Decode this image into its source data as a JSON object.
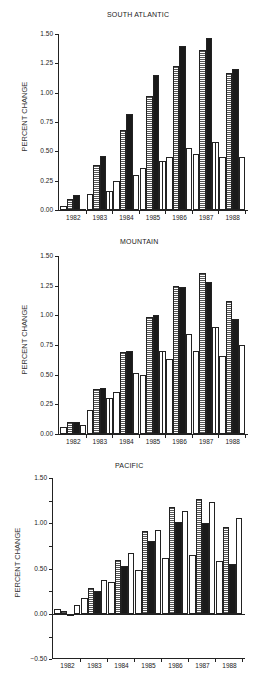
{
  "chart_data": [
    {
      "type": "bar",
      "title": "SOUTH ATLANTIC",
      "xlabel": "",
      "ylabel": "PERCENT CHANGE",
      "ylim": [
        0.0,
        1.5
      ],
      "yticks": [
        "0.00",
        "0.25",
        "0.50",
        "0.75",
        "1.00",
        "1.25",
        "1.50"
      ],
      "categories": [
        "1982",
        "1983",
        "1984",
        "1985",
        "1986",
        "1987",
        "1988"
      ],
      "grid": false,
      "legend": "none",
      "series": [
        {
          "name": "Series 1 (open)",
          "pattern": "white",
          "values": [
            0.03,
            0.14,
            0.25,
            0.36,
            0.45,
            0.48,
            0.45
          ]
        },
        {
          "name": "Series 2 (horizontal hatch)",
          "pattern": "hstripe",
          "values": [
            0.09,
            0.38,
            0.68,
            0.97,
            1.23,
            1.36,
            1.17
          ]
        },
        {
          "name": "Series 3 (solid)",
          "pattern": "black",
          "values": [
            0.13,
            0.46,
            0.82,
            1.15,
            1.4,
            1.47,
            1.2
          ]
        },
        {
          "name": "Series 4 (vertical line)",
          "pattern": "vline",
          "values": [
            0.01,
            0.16,
            0.3,
            0.42,
            0.53,
            0.58,
            0.45
          ]
        }
      ]
    },
    {
      "type": "bar",
      "title": "MOUNTAIN",
      "xlabel": "",
      "ylabel": "PERCENT CHANGE",
      "ylim": [
        0.0,
        1.5
      ],
      "yticks": [
        "0.00",
        "0.25",
        "0.50",
        "0.75",
        "1.00",
        "1.25",
        "1.50"
      ],
      "categories": [
        "1982",
        "1983",
        "1984",
        "1985",
        "1986",
        "1987",
        "1988"
      ],
      "grid": false,
      "legend": "none",
      "series": [
        {
          "name": "Series 1 (open)",
          "pattern": "white",
          "values": [
            0.06,
            0.2,
            0.35,
            0.5,
            0.63,
            0.7,
            0.66
          ]
        },
        {
          "name": "Series 2 (horizontal hatch)",
          "pattern": "hstripe",
          "values": [
            0.1,
            0.38,
            0.69,
            0.99,
            1.25,
            1.36,
            1.12
          ]
        },
        {
          "name": "Series 3 (solid)",
          "pattern": "black",
          "values": [
            0.1,
            0.39,
            0.7,
            1.0,
            1.24,
            1.28,
            0.97
          ]
        },
        {
          "name": "Series 4 (vertical line)",
          "pattern": "vline",
          "values": [
            0.08,
            0.3,
            0.51,
            0.7,
            0.84,
            0.9,
            0.75
          ]
        }
      ]
    },
    {
      "type": "bar",
      "title": "PACIFIC",
      "xlabel": "",
      "ylabel": "PERCENT CHANGE",
      "ylim": [
        -0.5,
        1.5
      ],
      "yticks": [
        "−0.50",
        "0.00",
        "0.50",
        "1.00",
        "1.50"
      ],
      "categories": [
        "1982",
        "1983",
        "1984",
        "1985",
        "1986",
        "1987",
        "1988"
      ],
      "grid": false,
      "legend": "none",
      "series": [
        {
          "name": "Series 1 (open)",
          "pattern": "white",
          "values": [
            0.05,
            0.18,
            0.35,
            0.49,
            0.62,
            0.65,
            0.58
          ]
        },
        {
          "name": "Series 2 (horizontal hatch)",
          "pattern": "hstripe",
          "values": [
            0.03,
            0.29,
            0.6,
            0.91,
            1.18,
            1.27,
            0.96
          ]
        },
        {
          "name": "Series 3 (solid)",
          "pattern": "black",
          "values": [
            0.0,
            0.25,
            0.53,
            0.8,
            1.02,
            1.0,
            0.55
          ]
        },
        {
          "name": "Series 4 (vertical line)",
          "pattern": "vline",
          "values": [
            0.1,
            0.37,
            0.67,
            0.93,
            1.14,
            1.23,
            1.06
          ]
        }
      ]
    }
  ],
  "layout": [
    {
      "top": 0,
      "title_x": 137,
      "title_y": 16,
      "y_top_px": 34,
      "y_zero_px": 210,
      "y_bottom_px": 210,
      "x_left": 58,
      "x_right": 248,
      "xlabel_y": 214,
      "ylabel_cx": 24,
      "ylabel_cy": 122
    },
    {
      "top": 0,
      "title_x": 150,
      "title_y": 243,
      "y_top_px": 256,
      "y_zero_px": 434,
      "y_bottom_px": 434,
      "x_left": 58,
      "x_right": 248,
      "xlabel_y": 438,
      "ylabel_cx": 24,
      "ylabel_cy": 345
    },
    {
      "top": 0,
      "title_x": 145,
      "title_y": 467,
      "y_top_px": 478,
      "y_zero_px": 614,
      "y_bottom_px": 658,
      "x_left": 52,
      "x_right": 245,
      "xlabel_y": 662,
      "ylabel_cx": 17,
      "ylabel_cy": 568
    }
  ]
}
